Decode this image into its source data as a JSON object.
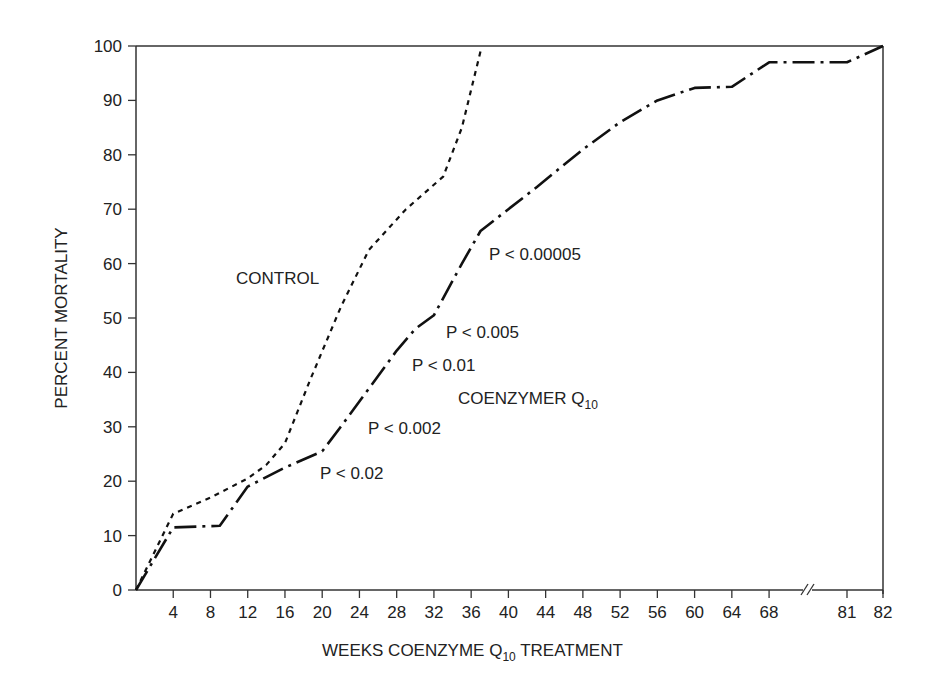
{
  "chart_data": {
    "type": "line",
    "title": "",
    "xlabel": "WEEKS COENZYME Q10 TREATMENT",
    "xlabel_main": "WEEKS COENZYME Q",
    "xlabel_sub": "10",
    "xlabel_tail": " TREATMENT",
    "ylabel": "PERCENT MORTALITY",
    "xlim": [
      0,
      82
    ],
    "ylim": [
      0,
      100
    ],
    "x_ticks": [
      "4",
      "8",
      "12",
      "16",
      "20",
      "24",
      "28",
      "32",
      "36",
      "40",
      "44",
      "48",
      "52",
      "56",
      "60",
      "64",
      "68",
      "81",
      "82"
    ],
    "y_ticks": [
      "0",
      "10",
      "20",
      "30",
      "40",
      "50",
      "60",
      "70",
      "80",
      "90",
      "100"
    ],
    "axis_break": "between 68 and 81",
    "grid": false,
    "series": [
      {
        "name": "CONTROL",
        "style": "dashed",
        "points": [
          [
            0,
            0
          ],
          [
            4,
            14
          ],
          [
            8,
            17
          ],
          [
            12,
            20.5
          ],
          [
            14,
            23
          ],
          [
            16,
            27
          ],
          [
            18.7,
            38.6
          ],
          [
            22,
            52
          ],
          [
            25,
            62.5
          ],
          [
            29,
            70
          ],
          [
            33,
            76
          ],
          [
            35,
            85
          ],
          [
            37,
            99
          ]
        ]
      },
      {
        "name": "COENZYMER Q10",
        "style": "dash-dot",
        "points": [
          [
            0,
            0
          ],
          [
            4,
            11.5
          ],
          [
            9,
            11.8
          ],
          [
            12,
            19
          ],
          [
            16,
            22.5
          ],
          [
            20,
            25.5
          ],
          [
            22,
            30
          ],
          [
            25,
            37
          ],
          [
            28,
            44
          ],
          [
            30,
            48
          ],
          [
            32,
            50.5
          ],
          [
            35,
            60
          ],
          [
            37,
            66
          ],
          [
            40,
            70
          ],
          [
            43,
            74
          ],
          [
            48,
            81
          ],
          [
            52,
            86
          ],
          [
            56,
            90
          ],
          [
            60,
            92.3
          ],
          [
            64,
            92.5
          ],
          [
            68,
            97
          ],
          [
            81,
            97
          ],
          [
            82,
            100
          ]
        ]
      }
    ],
    "annotations": [
      {
        "text": "CONTROL",
        "x_px": 236,
        "y_px": 284
      },
      {
        "text": "COENZYMER Q",
        "sub": "10",
        "x_px": 458,
        "y_px": 404
      },
      {
        "text": "P < 0.02",
        "x_px": 320,
        "y_px": 479
      },
      {
        "text": "P < 0.002",
        "x_px": 368,
        "y_px": 434
      },
      {
        "text": "P < 0.01",
        "x_px": 412,
        "y_px": 371
      },
      {
        "text": "P < 0.005",
        "x_px": 446,
        "y_px": 338
      },
      {
        "text": "P < 0.00005",
        "x_px": 489,
        "y_px": 260
      }
    ]
  }
}
